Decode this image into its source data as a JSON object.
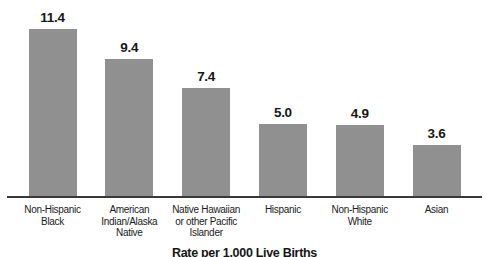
{
  "chart_data": {
    "type": "bar",
    "categories": [
      "Non-Hispanic\nBlack",
      "American\nIndian/Alaska\nNative",
      "Native Hawaiian\nor other Pacific\nIslander",
      "Hispanic",
      "Non-Hispanic\nWhite",
      "Asian"
    ],
    "values": [
      11.4,
      9.4,
      7.4,
      5.0,
      4.9,
      3.6
    ],
    "value_labels": [
      "11.4",
      "9.4",
      "7.4",
      "5.0",
      "4.9",
      "3.6"
    ],
    "title": "",
    "xlabel": "Rate per 1,000 Live Births",
    "ylabel": "",
    "ylim": [
      0,
      12
    ],
    "grid": false,
    "legend_position": "none",
    "bar_color": "#909090",
    "axis_color": "#3a3a3a",
    "label_color": "#1a1a1a"
  }
}
